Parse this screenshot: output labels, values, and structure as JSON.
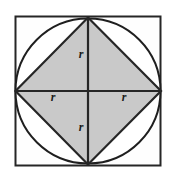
{
  "figure": {
    "canvas": {
      "width": 173,
      "height": 180,
      "background": "#ffffff"
    },
    "colors": {
      "stroke": "#262626",
      "circle_stroke": "#1f1f1f",
      "inner_square_fill": "#c9c9c9",
      "outer_square_fill": "#fefefe",
      "label_color": "#1a1a1a"
    },
    "outer_square": {
      "name": "outer-square",
      "x": 15.5,
      "y": 16.5,
      "width": 145,
      "height": 149,
      "stroke_width": 2
    },
    "circle": {
      "name": "inscribed-circle",
      "cx": 88,
      "cy": 91,
      "r": 72.5,
      "stroke_width": 2
    },
    "inner_square": {
      "name": "inscribed-square",
      "points": "88,17.5 161,91 88,164.5 15.5,91",
      "stroke_width": 2.2
    },
    "diameters": [
      {
        "name": "horizontal-diameter",
        "x1": 15.5,
        "y1": 91,
        "x2": 161,
        "y2": 91
      },
      {
        "name": "vertical-diameter",
        "x1": 88,
        "y1": 17.5,
        "x2": 88,
        "y2": 164.5
      }
    ],
    "labels": [
      {
        "id": "label-r-top",
        "text": "r",
        "x": 81,
        "y": 58
      },
      {
        "id": "label-r-left",
        "text": "r",
        "x": 53,
        "y": 101
      },
      {
        "id": "label-r-right",
        "text": "r",
        "x": 124,
        "y": 101
      },
      {
        "id": "label-r-bottom",
        "text": "r",
        "x": 81,
        "y": 131
      }
    ]
  }
}
